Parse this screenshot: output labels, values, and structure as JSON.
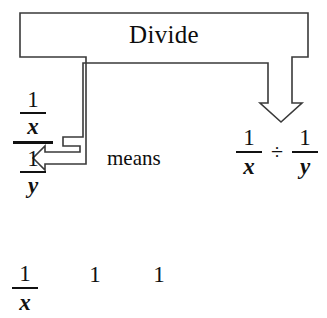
{
  "diagram": {
    "type": "math-callout-diagram",
    "background_color": "#ffffff",
    "ink_color": "#111111",
    "outline_color": "#3a3a3a",
    "callout": {
      "label": "Divide",
      "shape": "rectangle-with-two-pointer-arrows",
      "arrows": [
        {
          "name": "left-arrow",
          "direction": "left",
          "style": "hollow-outline",
          "points_to": "main fraction bar of the complex fraction"
        },
        {
          "name": "right-arrow",
          "direction": "down",
          "style": "hollow-outline",
          "points_to": "division sign"
        }
      ]
    },
    "connector_text": "means",
    "complex_fraction": {
      "numerator": {
        "num": "1",
        "den": "x"
      },
      "denominator": {
        "num": "1",
        "den": "y"
      }
    },
    "right_expression": {
      "left_fraction": {
        "num": "1",
        "den": "x"
      },
      "operator": "÷",
      "right_fraction": {
        "num": "1",
        "den": "y"
      }
    },
    "bottom_row": {
      "cut_off": true,
      "fraction": {
        "num": "1",
        "den": "x"
      },
      "loose_numerator_1": "1",
      "loose_numerator_2": "1"
    }
  }
}
